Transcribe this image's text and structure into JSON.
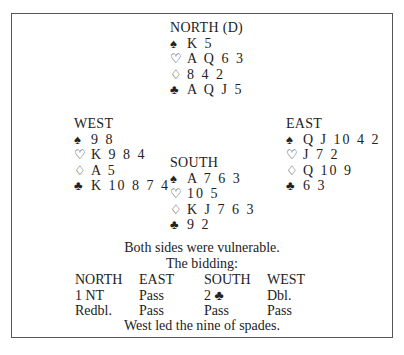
{
  "hands": {
    "north": {
      "title": "NORTH (D)",
      "spades": "K 5",
      "hearts": "A Q 6 3",
      "diamonds": "8 4 2",
      "clubs": "A Q J 5"
    },
    "west": {
      "title": "WEST",
      "spades": "9 8",
      "hearts": "K 9 8 4",
      "diamonds": "A 5",
      "clubs": "K 10 8 7 4"
    },
    "east": {
      "title": "EAST",
      "spades": "Q J 10 4 2",
      "hearts": "J 7 2",
      "diamonds": "Q 10 9",
      "clubs": "6 3"
    },
    "south": {
      "title": "SOUTH",
      "spades": "A 7 6 3",
      "hearts": "10 5",
      "diamonds": "K J 7 6 3",
      "clubs": "9 2"
    }
  },
  "suits": {
    "spade": "♠",
    "heart": "♡",
    "diamond": "♢",
    "club": "♣"
  },
  "vulnerability": "Both sides were vulnerable.",
  "bidding": {
    "label": "The bidding:",
    "headers": [
      "NORTH",
      "EAST",
      "SOUTH",
      "WEST"
    ],
    "rows": [
      [
        "1 NT",
        "Pass",
        "2 ♣",
        "Dbl."
      ],
      [
        "Redbl.",
        "Pass",
        "Pass",
        "Pass"
      ]
    ]
  },
  "opening_lead": "West led the nine of spades."
}
